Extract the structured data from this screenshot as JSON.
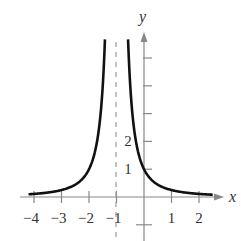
{
  "chart_data": {
    "type": "line",
    "title": "",
    "function": "y = 1/(x+1)^2",
    "xlabel": "x",
    "ylabel": "y",
    "xlim": [
      -4.5,
      2.5
    ],
    "ylim": [
      -1.5,
      5.6
    ],
    "x_ticks": [
      -4,
      -3,
      -2,
      -1,
      1,
      2
    ],
    "x_tick_labels": [
      "−4",
      "−3",
      "−2",
      "−1",
      "1",
      "2"
    ],
    "y_ticks": [
      -1,
      1,
      2,
      3,
      4,
      5
    ],
    "y_tick_labels": [
      "1",
      "2"
    ],
    "asymptotes": [
      {
        "type": "vertical",
        "x": -1,
        "style": "dashed"
      },
      {
        "type": "horizontal",
        "y": 0
      }
    ],
    "series": [
      {
        "name": "left branch",
        "x": [
          -4.2,
          -4,
          -3,
          -2,
          -1.5,
          -1.42
        ],
        "y": [
          0.098,
          0.111,
          0.25,
          1,
          4,
          5.6
        ]
      },
      {
        "name": "right branch",
        "x": [
          -0.58,
          -0.5,
          0,
          1,
          2,
          2.5
        ],
        "y": [
          5.6,
          4,
          1,
          0.25,
          0.111,
          0.082
        ]
      }
    ],
    "grid": false,
    "legend": null
  },
  "labels": {
    "x_axis": "x",
    "y_axis": "y",
    "x_ticks": [
      "−4",
      "−3",
      "−2",
      "−1",
      "1",
      "2"
    ],
    "y_ticks": [
      "1",
      "2"
    ]
  }
}
